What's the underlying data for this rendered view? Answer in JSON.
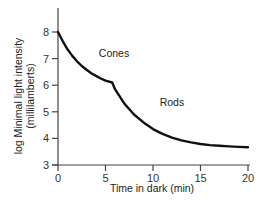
{
  "chart_data": {
    "type": "line",
    "title": "",
    "xlabel": "Time in dark (min)",
    "ylabel_line1": "log Minimal light intensity",
    "ylabel_line2": "(millilamberts)",
    "xlim": [
      0,
      20
    ],
    "ylim": [
      3,
      8
    ],
    "x_ticks": [
      0,
      5,
      10,
      15,
      20
    ],
    "y_ticks": [
      3,
      4,
      5,
      6,
      7,
      8
    ],
    "grid": false,
    "legend": "none",
    "series": [
      {
        "name": "Dark adaptation curve",
        "x": [
          0,
          0.5,
          1,
          1.5,
          2,
          2.5,
          3,
          3.5,
          4,
          4.5,
          5,
          5.7,
          6,
          7,
          8,
          9,
          10,
          11,
          12,
          13,
          14,
          15,
          16,
          17,
          18,
          19,
          20
        ],
        "y": [
          8.0,
          7.65,
          7.35,
          7.1,
          6.9,
          6.72,
          6.58,
          6.45,
          6.35,
          6.25,
          6.17,
          6.1,
          5.85,
          5.3,
          4.9,
          4.6,
          4.35,
          4.17,
          4.03,
          3.93,
          3.85,
          3.79,
          3.75,
          3.72,
          3.7,
          3.68,
          3.67
        ]
      }
    ],
    "annotations": [
      {
        "text": "Cones",
        "x": 4.3,
        "y": 7.05
      },
      {
        "text": "Rods",
        "x": 10.7,
        "y": 5.2
      }
    ]
  }
}
